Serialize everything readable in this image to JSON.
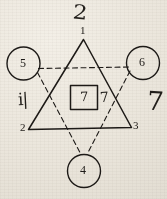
{
  "figure": {
    "ink_color": "#1d1a17",
    "paper_color": "#efebe2",
    "solid_triangle": {
      "name": "upward-triangle",
      "style": "solid",
      "vertex_labels": [
        "1",
        "2",
        "3"
      ]
    },
    "dashed_triangle": {
      "name": "downward-triangle",
      "style": "dashed",
      "vertex_labels": [
        "5",
        "6",
        "4"
      ]
    },
    "circles": [
      {
        "label": "5",
        "position": "left"
      },
      {
        "label": "6",
        "position": "right"
      },
      {
        "label": "4",
        "position": "bottom"
      }
    ],
    "center_box": {
      "label": "7",
      "shape": "square"
    },
    "vertex_labels": {
      "apex": "1",
      "bottom_left": "2",
      "bottom_right": "3"
    },
    "margin_marks": {
      "top": "2",
      "left": "i|",
      "box_right": "7",
      "right": "7"
    }
  }
}
